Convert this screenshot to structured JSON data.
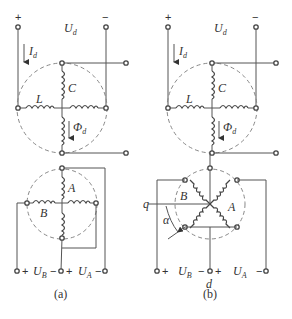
{
  "figure_a": {
    "caption": "(a)",
    "top_plus": "+",
    "top_minus": "−",
    "voltage_top": "U",
    "voltage_top_sub": "d",
    "current": "I",
    "current_sub": "d",
    "coil_c": "C",
    "coil_l": "L",
    "flux": "Φ",
    "flux_sub": "d",
    "coil_a": "A",
    "coil_b": "B",
    "bottom_plus_1": "+",
    "bottom_minus_1": "−",
    "bottom_plus_2": "+",
    "bottom_minus_2": "−",
    "voltage_b": "U",
    "voltage_b_sub": "B",
    "voltage_a": "U",
    "voltage_a_sub": "A"
  },
  "figure_b": {
    "caption": "(b)",
    "top_plus": "+",
    "top_minus": "−",
    "voltage_top": "U",
    "voltage_top_sub": "d",
    "current": "I",
    "current_sub": "d",
    "coil_c": "C",
    "coil_l": "L",
    "flux": "Φ",
    "flux_sub": "d",
    "coil_a": "A",
    "coil_b": "B",
    "axis_q": "q",
    "axis_d": "d",
    "angle": "α",
    "bottom_plus_1": "+",
    "bottom_minus_1": "−",
    "bottom_plus_2": "+",
    "bottom_minus_2": "−",
    "voltage_b": "U",
    "voltage_b_sub": "B",
    "voltage_a": "U",
    "voltage_a_sub": "A"
  }
}
